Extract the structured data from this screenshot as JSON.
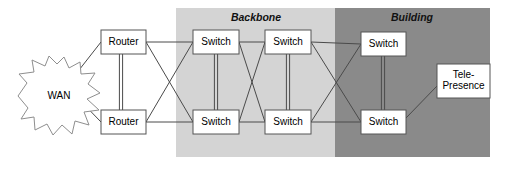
{
  "diagram": {
    "zones": [
      {
        "id": "backbone",
        "label": "Backbone",
        "color": "#d4d4d4",
        "x": 176,
        "y": 8,
        "width": 159,
        "height": 149,
        "label_x": 256,
        "label_y": 18
      },
      {
        "id": "building",
        "label": "Building",
        "color": "#8a8a8a",
        "x": 335,
        "y": 8,
        "width": 155,
        "height": 149,
        "label_x": 412,
        "label_y": 18
      }
    ],
    "cloud": {
      "id": "wan",
      "label": "WAN",
      "label_x": 59,
      "label_y": 96,
      "points": "18,96 27,83 19,74 34,72 32,60 45,66 49,56 57,64 64,57 69,68 80,62 81,74 95,73 88,84 100,93 87,99 99,110 84,112 89,125 75,121 72,134 62,125 53,135 47,124 35,130 34,117 21,119 28,108"
    },
    "nodes": [
      {
        "id": "router-top",
        "label": "Router",
        "x": 101,
        "y": 30,
        "width": 45,
        "height": 24
      },
      {
        "id": "router-bottom",
        "label": "Router",
        "x": 101,
        "y": 110,
        "width": 45,
        "height": 24
      },
      {
        "id": "switch-bb-top-1",
        "label": "Switch",
        "x": 193,
        "y": 30,
        "width": 46,
        "height": 24
      },
      {
        "id": "switch-bb-bot-1",
        "label": "Switch",
        "x": 193,
        "y": 110,
        "width": 46,
        "height": 24
      },
      {
        "id": "switch-bb-top-2",
        "label": "Switch",
        "x": 265,
        "y": 30,
        "width": 46,
        "height": 24
      },
      {
        "id": "switch-bb-bot-2",
        "label": "Switch",
        "x": 265,
        "y": 110,
        "width": 46,
        "height": 24
      },
      {
        "id": "switch-bldg-top",
        "label": "Switch",
        "x": 361,
        "y": 32,
        "width": 45,
        "height": 24
      },
      {
        "id": "switch-bldg-bot",
        "label": "Switch",
        "x": 361,
        "y": 110,
        "width": 45,
        "height": 24
      },
      {
        "id": "telepresence",
        "label": "Tele-\nPresence",
        "x": 437,
        "y": 64,
        "width": 53,
        "height": 34
      }
    ],
    "node_labels": {
      "router_top": "Router",
      "router_bottom": "Router",
      "switch_bb_top_1": "Switch",
      "switch_bb_bot_1": "Switch",
      "switch_bb_top_2": "Switch",
      "switch_bb_bot_2": "Switch",
      "switch_bldg_top": "Switch",
      "switch_bldg_bot": "Switch",
      "telepresence_line1": "Tele-",
      "telepresence_line2": "Presence"
    },
    "links": [
      {
        "id": "wan-router-top",
        "from": "wan",
        "to": "router-top",
        "x1": 72,
        "y1": 79,
        "x2": 101,
        "y2": 42,
        "style": "single"
      },
      {
        "id": "wan-router-bottom",
        "from": "wan",
        "to": "router-bottom",
        "x1": 72,
        "y1": 92,
        "x2": 101,
        "y2": 122,
        "style": "single"
      },
      {
        "id": "router-router-a",
        "from": "router-top",
        "to": "router-bottom",
        "x1": 121,
        "y1": 54,
        "x2": 121,
        "y2": 110,
        "style": "double"
      },
      {
        "id": "rt-to-sw-bb-top",
        "from": "router-top",
        "to": "switch-bb-top-1",
        "x1": 146,
        "y1": 42,
        "x2": 193,
        "y2": 42,
        "style": "single"
      },
      {
        "id": "rt-to-sw-bb-bot",
        "from": "router-top",
        "to": "switch-bb-bot-1",
        "x1": 146,
        "y1": 42,
        "x2": 193,
        "y2": 122,
        "style": "single"
      },
      {
        "id": "rb-to-sw-bb-top",
        "from": "router-bottom",
        "to": "switch-bb-top-1",
        "x1": 146,
        "y1": 122,
        "x2": 193,
        "y2": 42,
        "style": "single"
      },
      {
        "id": "rb-to-sw-bb-bot",
        "from": "router-bottom",
        "to": "switch-bb-bot-1",
        "x1": 146,
        "y1": 122,
        "x2": 193,
        "y2": 122,
        "style": "single"
      },
      {
        "id": "sw1-trunk",
        "from": "switch-bb-top-1",
        "to": "switch-bb-bot-1",
        "x1": 216,
        "y1": 54,
        "x2": 216,
        "y2": 110,
        "style": "double"
      },
      {
        "id": "sw1t-sw2t",
        "from": "switch-bb-top-1",
        "to": "switch-bb-top-2",
        "x1": 239,
        "y1": 42,
        "x2": 265,
        "y2": 42,
        "style": "single"
      },
      {
        "id": "sw1t-sw2b",
        "from": "switch-bb-top-1",
        "to": "switch-bb-bot-2",
        "x1": 239,
        "y1": 42,
        "x2": 265,
        "y2": 122,
        "style": "single"
      },
      {
        "id": "sw1b-sw2t",
        "from": "switch-bb-bot-1",
        "to": "switch-bb-top-2",
        "x1": 239,
        "y1": 122,
        "x2": 265,
        "y2": 42,
        "style": "single"
      },
      {
        "id": "sw1b-sw2b",
        "from": "switch-bb-bot-1",
        "to": "switch-bb-bot-2",
        "x1": 239,
        "y1": 122,
        "x2": 265,
        "y2": 122,
        "style": "single"
      },
      {
        "id": "sw2-trunk",
        "from": "switch-bb-top-2",
        "to": "switch-bb-bot-2",
        "x1": 288,
        "y1": 54,
        "x2": 288,
        "y2": 110,
        "style": "double"
      },
      {
        "id": "sw2t-bldgt",
        "from": "switch-bb-top-2",
        "to": "switch-bldg-top",
        "x1": 311,
        "y1": 42,
        "x2": 361,
        "y2": 44,
        "style": "single"
      },
      {
        "id": "sw2t-bldgb",
        "from": "switch-bb-top-2",
        "to": "switch-bldg-bot",
        "x1": 311,
        "y1": 42,
        "x2": 361,
        "y2": 122,
        "style": "single"
      },
      {
        "id": "sw2b-bldgt",
        "from": "switch-bb-bot-2",
        "to": "switch-bldg-top",
        "x1": 311,
        "y1": 122,
        "x2": 361,
        "y2": 44,
        "style": "single"
      },
      {
        "id": "sw2b-bldgb",
        "from": "switch-bb-bot-2",
        "to": "switch-bldg-bot",
        "x1": 311,
        "y1": 122,
        "x2": 361,
        "y2": 122,
        "style": "single"
      },
      {
        "id": "bldg-trunk",
        "from": "switch-bldg-top",
        "to": "switch-bldg-bot",
        "x1": 383,
        "y1": 56,
        "x2": 383,
        "y2": 110,
        "style": "double"
      },
      {
        "id": "bldgb-telepresence",
        "from": "switch-bldg-bot",
        "to": "telepresence",
        "x1": 406,
        "y1": 118,
        "x2": 437,
        "y2": 86,
        "style": "single"
      }
    ]
  }
}
